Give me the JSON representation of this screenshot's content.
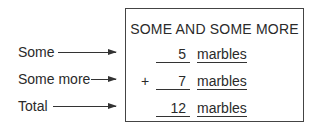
{
  "title": "SOME AND SOME MORE",
  "rows": [
    {
      "label": "Some",
      "operator": "",
      "value": "5",
      "unit": "marbles"
    },
    {
      "label": "Some more",
      "operator": "+",
      "value": "7",
      "unit": "marbles"
    },
    {
      "label": "Total",
      "operator": "",
      "value": "12",
      "unit": "marbles"
    }
  ]
}
